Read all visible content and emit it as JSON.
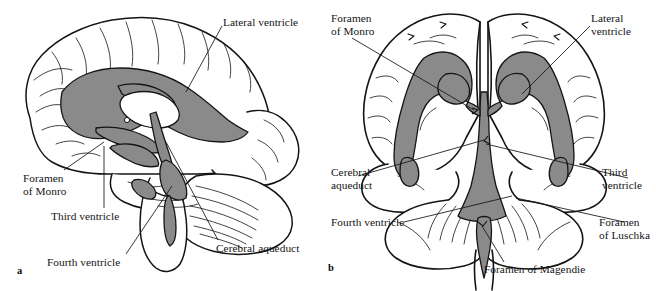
{
  "figure": {
    "colors": {
      "ventricle_fill": "#8a8a8a",
      "outline": "#141414",
      "background": "#ffffff",
      "text": "#141414"
    }
  },
  "panel_a": {
    "key": "a",
    "view": "midsagittal",
    "labels": {
      "lateral_ventricle": "Lateral ventricle",
      "foramen_of_monro_line1": "Foramen",
      "foramen_of_monro_line2": "of Monro",
      "third_ventricle": "Third ventricle",
      "fourth_ventricle": "Fourth ventricle",
      "cerebral_aqueduct": "Cerebral aqueduct"
    }
  },
  "panel_b": {
    "key": "b",
    "view": "anterior-coronal",
    "labels": {
      "foramen_of_monro_line1": "Foramen",
      "foramen_of_monro_line2": "of Monro",
      "lateral_ventricle_line1": "Lateral",
      "lateral_ventricle_line2": "ventricle",
      "cerebral_aqueduct_line1": "Cerebral",
      "cerebral_aqueduct_line2": "aqueduct",
      "third_ventricle_line1": "Third",
      "third_ventricle_line2": "ventricle",
      "fourth_ventricle": "Fourth ventricle",
      "foramen_of_luschka_line1": "Foramen",
      "foramen_of_luschka_line2": "of Luschka",
      "foramen_of_magendie": "Foramen of Magendie"
    }
  }
}
